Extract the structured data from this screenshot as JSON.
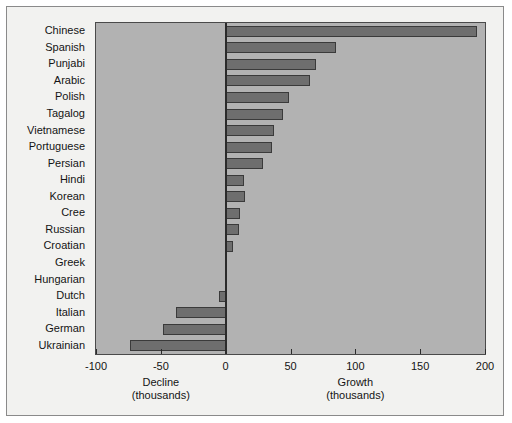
{
  "chart_data": {
    "type": "bar",
    "orientation": "horizontal",
    "title": "",
    "xlabel": "",
    "ylabel": "",
    "xlim": [
      -100,
      200
    ],
    "xticks": [
      -100,
      -50,
      0,
      50,
      100,
      150,
      200
    ],
    "xtick_labels": [
      "-100",
      "-50",
      "0",
      "50",
      "100",
      "150",
      "200"
    ],
    "grid": false,
    "legend": "none",
    "units": "thousands",
    "left_axis_caption_line1": "Decline",
    "left_axis_caption_line2": "(thousands)",
    "right_axis_caption_line1": "Growth",
    "right_axis_caption_line2": "(thousands)",
    "categories": [
      "Chinese",
      "Spanish",
      "Punjabi",
      "Arabic",
      "Polish",
      "Tagalog",
      "Vietnamese",
      "Portuguese",
      "Persian",
      "Hindi",
      "Korean",
      "Cree",
      "Russian",
      "Croatian",
      "Greek",
      "Hungarian",
      "Dutch",
      "Italian",
      "German",
      "Ukrainian"
    ],
    "values": [
      194,
      85,
      70,
      65,
      49,
      44,
      37,
      36,
      29,
      14,
      15,
      11,
      10,
      6,
      0,
      0,
      -5,
      -38,
      -48,
      -74
    ],
    "colors": {
      "bar_fill": "#6e6e6e",
      "bar_edge": "#3a3a3a",
      "plot_background": "#b2b2b2",
      "figure_background": "#f2f2f0",
      "axis_line": "#2b2b2b",
      "text": "#141414"
    }
  }
}
